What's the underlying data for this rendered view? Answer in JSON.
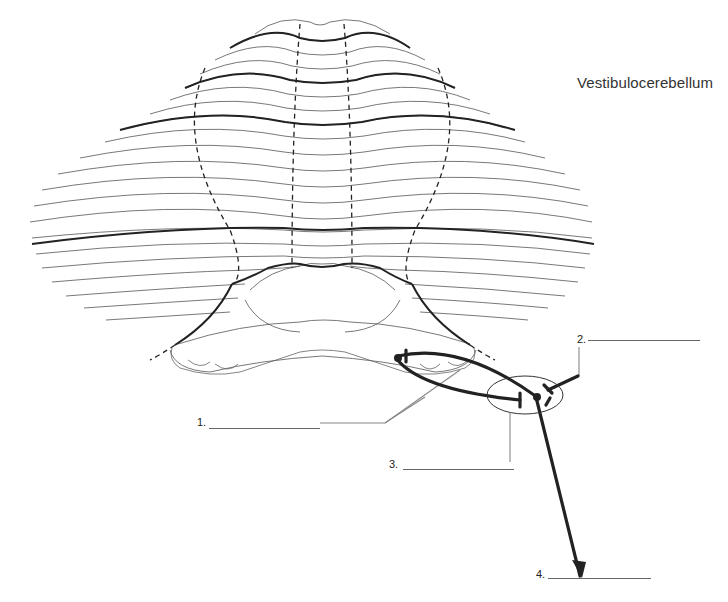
{
  "diagram": {
    "title": "Vestibulocerebellum",
    "labels": [
      {
        "number": "1.",
        "blank": ""
      },
      {
        "number": "2.",
        "blank": ""
      },
      {
        "number": "3.",
        "blank": ""
      },
      {
        "number": "4.",
        "blank": ""
      }
    ],
    "colors": {
      "outline": "#444444",
      "thick_line": "#222222",
      "leader_line": "#888888",
      "text": "#333333",
      "background": "#ffffff"
    }
  }
}
